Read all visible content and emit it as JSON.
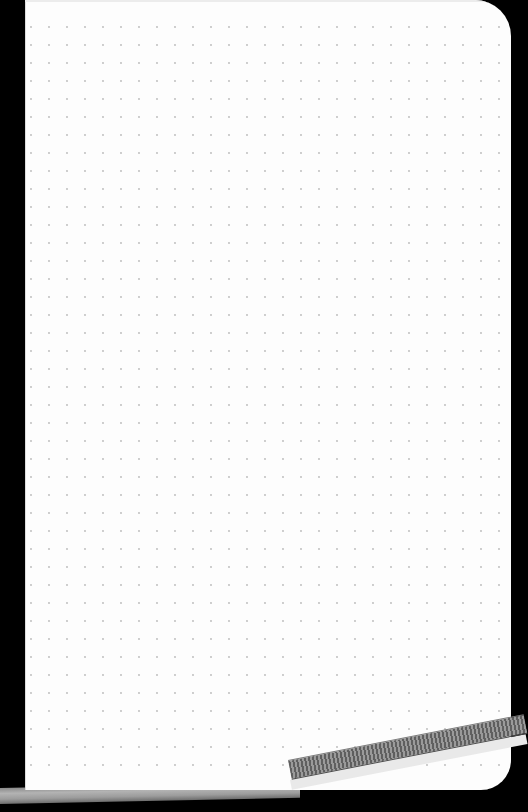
{
  "scene": {
    "subject": "dot-grid notebook page",
    "background_color": "#000000",
    "page_color": "#fdfdfd",
    "dot_color": "#b8b8b8",
    "band_color": "#7a7a7a",
    "pen_color": "#a0a0a0"
  },
  "dot_grid": {
    "origin_x": 6,
    "origin_y": 27,
    "spacing": 18,
    "columns": 27,
    "rows": 42
  }
}
